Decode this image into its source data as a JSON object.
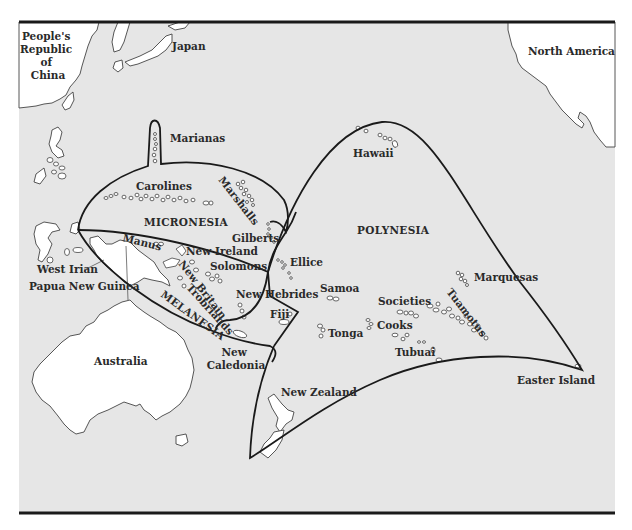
{
  "map": {
    "title": "",
    "colors": {
      "sea": "#e6e6e6",
      "land": "#ffffff",
      "boundary": "#1a1a1a",
      "label": "#2a2a2a"
    },
    "landmasses": {
      "china": "People's Republic of China",
      "china_lines": [
        "People's",
        "Republic",
        "of",
        "China"
      ],
      "japan": "Japan",
      "north_america": "North America",
      "australia": "Australia",
      "new_zealand": "New Zealand",
      "west_irian": "West Irian",
      "papua_new_guinea": "Papua New Guinea"
    },
    "regions": {
      "micronesia": "MICRONESIA",
      "melanesia": "MELANESIA",
      "polynesia": "POLYNESIA"
    },
    "island_groups": {
      "marianas": "Marianas",
      "carolines": "Carolines",
      "marshalls": "Marshalls",
      "gilberts": "Gilberts",
      "manus": "Manus",
      "new_ireland": "New Ireland",
      "solomons": "Solomons",
      "new_britain": "New Britain",
      "trobriands": "Trobriands",
      "new_hebrides": "New Hebrides",
      "fiji": "Fiji",
      "new_caledonia_lines": [
        "New",
        "Caledonia"
      ],
      "ellice": "Ellice",
      "hawaii": "Hawaii",
      "samoa": "Samoa",
      "tonga": "Tonga",
      "cooks": "Cooks",
      "societies": "Societies",
      "tubuai": "Tubuai",
      "tuamotus": "Tuamotus",
      "marquesas": "Marquesas",
      "easter_island": "Easter Island"
    }
  }
}
